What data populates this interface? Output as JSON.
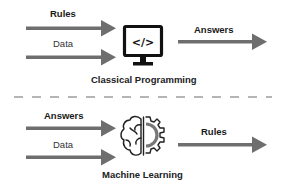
{
  "top_section": {
    "inputs": [
      {
        "label": "Rules",
        "weight": "bold"
      },
      {
        "label": "Data",
        "weight": "normal"
      }
    ],
    "output": {
      "label": "Answers"
    },
    "icon": "monitor-code-icon",
    "icon_text": "</>",
    "caption": "Classical Programming"
  },
  "bottom_section": {
    "inputs": [
      {
        "label": "Answers",
        "weight": "bold"
      },
      {
        "label": "Data",
        "weight": "normal"
      }
    ],
    "output": {
      "label": "Rules"
    },
    "icon": "brain-gear-icon",
    "caption": "Machine Learning"
  },
  "colors": {
    "arrow": "#6e6e6e",
    "icon": "#111111",
    "divider": "#b5b5b5",
    "gear_accent": "#777777"
  }
}
